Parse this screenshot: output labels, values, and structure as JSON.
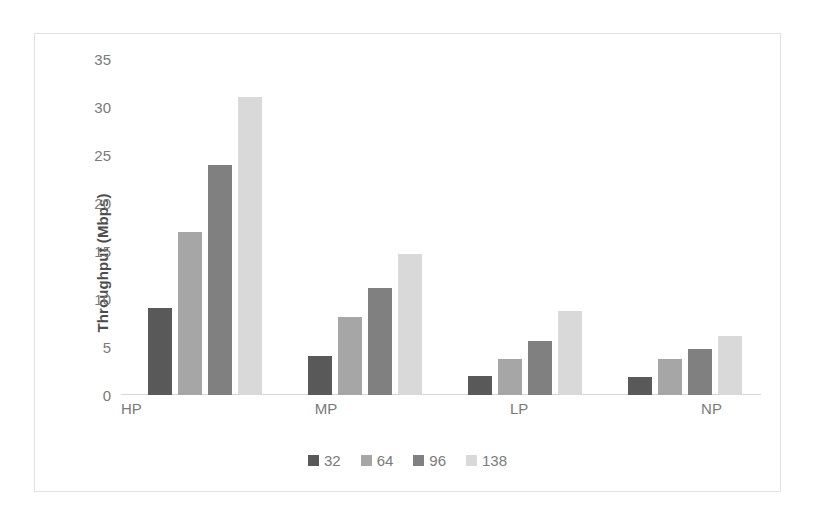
{
  "chart_data": {
    "type": "bar",
    "title": "",
    "xlabel": "",
    "ylabel": "Throughput (Mbps)",
    "categories": [
      "HP",
      "MP",
      "LP",
      "NP"
    ],
    "series": [
      {
        "name": "32",
        "color": "#595959",
        "values": [
          9.1,
          4.1,
          2.0,
          1.9
        ]
      },
      {
        "name": "64",
        "color": "#a6a6a6",
        "values": [
          17.0,
          8.1,
          3.8,
          3.7
        ]
      },
      {
        "name": "96",
        "color": "#808080",
        "values": [
          24.0,
          11.1,
          5.6,
          4.8
        ]
      },
      {
        "name": "138",
        "color": "#d9d9d9",
        "values": [
          31.0,
          14.7,
          8.7,
          6.1
        ]
      }
    ],
    "ylim": [
      0,
      35
    ],
    "yticks": [
      "0",
      "5",
      "10",
      "15",
      "20",
      "25",
      "30",
      "35"
    ],
    "ytick_values": [
      0,
      5,
      10,
      15,
      20,
      25,
      30,
      35
    ],
    "grid": false,
    "legend_position": "bottom",
    "legend_entries": [
      "32",
      "64",
      "96",
      "138"
    ]
  }
}
